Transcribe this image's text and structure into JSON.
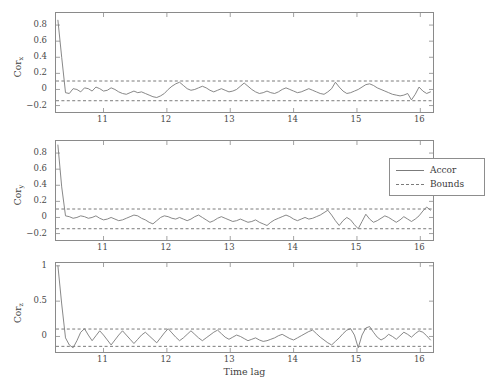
{
  "figure": {
    "xlabel": "Time lag",
    "legend": {
      "position": "top-right-panel-2",
      "entries": [
        {
          "label": "Accor",
          "style": "solid"
        },
        {
          "label": "Bounds",
          "style": "dashed"
        }
      ]
    },
    "colors": {
      "line": "#7b7b7b",
      "bounds": "#7b7b7b",
      "axis": "#8a8a8a",
      "text": "#3a3a3a",
      "background": "#ffffff"
    }
  },
  "chart_data": [
    {
      "type": "line",
      "title": "",
      "panel": "top",
      "ylabel": "Cor_x",
      "ylabel_base": "Cor",
      "ylabel_sub": "x",
      "xlabel": "",
      "xlim": [
        10.25,
        16.2
      ],
      "ylim": [
        -0.28,
        0.95
      ],
      "xticks": [
        11,
        12,
        13,
        14,
        15,
        16
      ],
      "yticks": [
        -0.2,
        0,
        0.2,
        0.4,
        0.6,
        0.8
      ],
      "ytick_labels": [
        "-0.2",
        "0",
        "0.2",
        "0.4",
        "0.6",
        "0.8"
      ],
      "grid": false,
      "bounds": {
        "upper": 0.105,
        "lower": -0.14
      },
      "series": [
        {
          "name": "Accor",
          "style": "solid",
          "x": [
            10.28,
            10.34,
            10.4,
            10.46,
            10.52,
            10.58,
            10.64,
            10.7,
            10.76,
            10.82,
            10.88,
            10.94,
            11.0,
            11.06,
            11.12,
            11.18,
            11.24,
            11.3,
            11.36,
            11.42,
            11.48,
            11.54,
            11.6,
            11.66,
            11.72,
            11.78,
            11.84,
            11.9,
            11.96,
            12.02,
            12.08,
            12.14,
            12.2,
            12.26,
            12.32,
            12.38,
            12.44,
            12.5,
            12.56,
            12.62,
            12.68,
            12.74,
            12.8,
            12.86,
            12.92,
            12.98,
            13.04,
            13.1,
            13.16,
            13.22,
            13.28,
            13.34,
            13.4,
            13.46,
            13.52,
            13.58,
            13.64,
            13.7,
            13.76,
            13.82,
            13.88,
            13.94,
            14.0,
            14.06,
            14.12,
            14.18,
            14.24,
            14.3,
            14.36,
            14.42,
            14.48,
            14.54,
            14.6,
            14.66,
            14.72,
            14.78,
            14.84,
            14.9,
            14.96,
            15.02,
            15.08,
            15.14,
            15.2,
            15.26,
            15.32,
            15.38,
            15.44,
            15.5,
            15.56,
            15.62,
            15.68,
            15.74,
            15.8,
            15.86,
            15.92,
            15.98,
            16.04,
            16.1,
            16.16
          ],
          "y": [
            0.86,
            0.4,
            -0.04,
            -0.05,
            0.01,
            0.0,
            -0.03,
            0.02,
            0.01,
            -0.02,
            0.03,
            0.01,
            -0.02,
            -0.01,
            0.02,
            0.0,
            -0.03,
            -0.05,
            -0.06,
            -0.04,
            -0.02,
            -0.04,
            -0.03,
            -0.05,
            -0.07,
            -0.09,
            -0.1,
            -0.08,
            -0.05,
            0.0,
            0.04,
            0.07,
            0.09,
            0.05,
            0.01,
            -0.01,
            0.0,
            0.02,
            0.04,
            0.02,
            -0.01,
            -0.03,
            -0.01,
            0.01,
            -0.01,
            -0.03,
            -0.02,
            0.0,
            0.04,
            0.08,
            0.04,
            0.0,
            -0.03,
            -0.05,
            -0.04,
            -0.02,
            -0.04,
            -0.05,
            -0.03,
            0.0,
            0.02,
            0.0,
            -0.02,
            -0.04,
            -0.03,
            -0.01,
            0.01,
            -0.01,
            -0.03,
            -0.05,
            -0.06,
            -0.03,
            0.01,
            0.09,
            0.03,
            -0.02,
            -0.05,
            -0.04,
            -0.02,
            0.0,
            0.03,
            0.06,
            0.07,
            0.05,
            0.02,
            0.0,
            -0.02,
            -0.04,
            -0.06,
            -0.07,
            -0.08,
            -0.07,
            -0.05,
            -0.13,
            -0.06,
            0.03,
            -0.02,
            -0.05,
            -0.03
          ]
        }
      ]
    },
    {
      "type": "line",
      "title": "",
      "panel": "middle",
      "ylabel": "Cor_y",
      "ylabel_base": "Cor",
      "ylabel_sub": "y",
      "xlabel": "",
      "xlim": [
        10.25,
        16.2
      ],
      "ylim": [
        -0.28,
        0.95
      ],
      "xticks": [
        11,
        12,
        13,
        14,
        15,
        16
      ],
      "yticks": [
        -0.2,
        0,
        0.2,
        0.4,
        0.6,
        0.8
      ],
      "ytick_labels": [
        "-0.2",
        "0",
        "0.2",
        "0.4",
        "0.6",
        "0.8"
      ],
      "grid": false,
      "bounds": {
        "upper": 0.105,
        "lower": -0.14
      },
      "series": [
        {
          "name": "Accor",
          "style": "solid",
          "x": [
            10.28,
            10.34,
            10.4,
            10.46,
            10.52,
            10.58,
            10.64,
            10.7,
            10.76,
            10.82,
            10.88,
            10.94,
            11.0,
            11.06,
            11.12,
            11.18,
            11.24,
            11.3,
            11.36,
            11.42,
            11.48,
            11.54,
            11.6,
            11.66,
            11.72,
            11.78,
            11.84,
            11.9,
            11.96,
            12.02,
            12.08,
            12.14,
            12.2,
            12.26,
            12.32,
            12.38,
            12.44,
            12.5,
            12.56,
            12.62,
            12.68,
            12.74,
            12.8,
            12.86,
            12.92,
            12.98,
            13.04,
            13.1,
            13.16,
            13.22,
            13.28,
            13.34,
            13.4,
            13.46,
            13.52,
            13.58,
            13.64,
            13.7,
            13.76,
            13.82,
            13.88,
            13.94,
            14.0,
            14.06,
            14.12,
            14.18,
            14.24,
            14.3,
            14.36,
            14.42,
            14.48,
            14.54,
            14.6,
            14.66,
            14.72,
            14.78,
            14.84,
            14.9,
            14.96,
            15.02,
            15.08,
            15.14,
            15.2,
            15.26,
            15.32,
            15.38,
            15.44,
            15.5,
            15.56,
            15.62,
            15.68,
            15.74,
            15.8,
            15.86,
            15.92,
            15.98,
            16.04,
            16.1,
            16.16
          ],
          "y": [
            0.9,
            0.38,
            0.02,
            0.01,
            -0.01,
            0.0,
            0.02,
            0.01,
            -0.01,
            0.0,
            0.02,
            -0.01,
            -0.03,
            -0.02,
            0.0,
            -0.02,
            -0.04,
            -0.03,
            -0.01,
            0.01,
            0.03,
            0.02,
            -0.01,
            -0.03,
            -0.06,
            -0.08,
            -0.04,
            0.0,
            0.02,
            0.01,
            -0.01,
            -0.02,
            0.0,
            -0.02,
            -0.04,
            -0.02,
            0.01,
            0.03,
            0.0,
            -0.03,
            -0.06,
            -0.04,
            -0.01,
            0.01,
            -0.01,
            -0.03,
            -0.05,
            -0.04,
            -0.02,
            -0.04,
            -0.06,
            -0.05,
            -0.03,
            -0.06,
            -0.08,
            -0.1,
            -0.06,
            -0.03,
            -0.01,
            0.01,
            0.03,
            0.01,
            -0.02,
            -0.04,
            -0.02,
            0.0,
            -0.02,
            -0.01,
            0.01,
            0.03,
            0.06,
            0.09,
            0.03,
            -0.04,
            -0.1,
            -0.04,
            0.0,
            -0.03,
            -0.09,
            -0.14,
            -0.05,
            0.04,
            -0.02,
            -0.06,
            -0.04,
            -0.01,
            0.02,
            0.0,
            -0.03,
            -0.06,
            -0.03,
            0.01,
            -0.02,
            -0.05,
            -0.02,
            0.02,
            0.08,
            0.13,
            0.09
          ]
        }
      ]
    },
    {
      "type": "line",
      "title": "",
      "panel": "bottom",
      "ylabel": "Cor_z",
      "ylabel_base": "Cor",
      "ylabel_sub": "z",
      "xlabel": "Time lag",
      "xlim": [
        10.25,
        16.2
      ],
      "ylim": [
        -0.22,
        1.04
      ],
      "xticks": [
        11,
        12,
        13,
        14,
        15,
        16
      ],
      "yticks": [
        0,
        0.5,
        1
      ],
      "ytick_labels": [
        "0",
        "0.5",
        "1"
      ],
      "grid": false,
      "bounds": {
        "upper": 0.105,
        "lower": -0.14
      },
      "series": [
        {
          "name": "Accor",
          "style": "solid",
          "x": [
            10.28,
            10.34,
            10.4,
            10.46,
            10.52,
            10.58,
            10.64,
            10.7,
            10.76,
            10.82,
            10.88,
            10.94,
            11.0,
            11.06,
            11.12,
            11.18,
            11.24,
            11.3,
            11.36,
            11.42,
            11.48,
            11.54,
            11.6,
            11.66,
            11.72,
            11.78,
            11.84,
            11.9,
            11.96,
            12.02,
            12.08,
            12.14,
            12.2,
            12.26,
            12.32,
            12.38,
            12.44,
            12.5,
            12.56,
            12.62,
            12.68,
            12.74,
            12.8,
            12.86,
            12.92,
            12.98,
            13.04,
            13.1,
            13.16,
            13.22,
            13.28,
            13.34,
            13.4,
            13.46,
            13.52,
            13.58,
            13.64,
            13.7,
            13.76,
            13.82,
            13.88,
            13.94,
            14.0,
            14.06,
            14.12,
            14.18,
            14.24,
            14.3,
            14.36,
            14.42,
            14.48,
            14.54,
            14.6,
            14.66,
            14.72,
            14.78,
            14.84,
            14.9,
            14.96,
            15.02,
            15.08,
            15.14,
            15.2,
            15.26,
            15.32,
            15.38,
            15.44,
            15.5,
            15.56,
            15.62,
            15.68,
            15.74,
            15.8,
            15.86,
            15.92,
            15.98,
            16.04,
            16.1,
            16.16
          ],
          "y": [
            1.0,
            0.46,
            -0.02,
            -0.12,
            -0.16,
            -0.06,
            0.06,
            0.11,
            0.02,
            -0.06,
            0.01,
            0.08,
            0.02,
            -0.05,
            -0.12,
            -0.05,
            0.02,
            0.08,
            0.02,
            -0.04,
            -0.1,
            -0.04,
            0.02,
            0.06,
            0.01,
            -0.04,
            -0.09,
            -0.02,
            0.05,
            0.11,
            0.05,
            -0.01,
            -0.06,
            -0.02,
            0.03,
            0.08,
            0.03,
            -0.02,
            -0.06,
            -0.02,
            0.02,
            0.06,
            0.09,
            0.04,
            -0.01,
            -0.04,
            -0.01,
            0.02,
            0.0,
            -0.03,
            -0.06,
            -0.04,
            -0.02,
            -0.05,
            -0.07,
            -0.06,
            -0.04,
            -0.02,
            0.01,
            0.03,
            0.0,
            -0.03,
            -0.05,
            -0.02,
            0.01,
            0.04,
            0.07,
            0.09,
            0.04,
            -0.01,
            -0.05,
            -0.09,
            -0.12,
            -0.07,
            -0.02,
            0.04,
            0.09,
            0.11,
            0.02,
            -0.16,
            0.02,
            0.12,
            0.14,
            0.06,
            -0.01,
            -0.05,
            -0.02,
            0.03,
            0.0,
            -0.04,
            0.01,
            0.06,
            0.03,
            -0.01,
            0.04,
            0.08,
            0.06,
            0.01,
            -0.05
          ]
        }
      ]
    }
  ]
}
